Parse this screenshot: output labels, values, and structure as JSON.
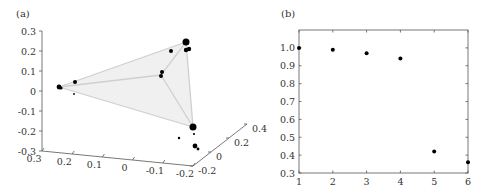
{
  "panels": {
    "a": "(a)",
    "b": "(b)"
  },
  "chart_data": [
    {
      "type": "scatter",
      "subtype": "3d-scatter",
      "panel_label": "(a)",
      "description": "3D scatter of points at vertices of a translucent tetrahedron (simplex)",
      "z_ticks": [
        "0.3",
        "0.2",
        "0.1",
        "0",
        "-0.1",
        "-0.2",
        "-0.3"
      ],
      "x_ticks": [
        "0.3",
        "0.2",
        "0.1",
        "0",
        "-0.1",
        "-0.2"
      ],
      "y_ticks": [
        "-0.2",
        "0",
        "0.2",
        "0.4"
      ],
      "zlim": [
        -0.3,
        0.3
      ],
      "xlim": [
        0.3,
        -0.2
      ],
      "ylim": [
        -0.2,
        0.4
      ],
      "grid": false,
      "vertices_screen": [
        {
          "name": "top-right",
          "x": 186,
          "y": 42
        },
        {
          "name": "left",
          "x": 59,
          "y": 87
        },
        {
          "name": "inner",
          "x": 161,
          "y": 75
        },
        {
          "name": "bottom",
          "x": 193,
          "y": 127
        }
      ],
      "points_screen": [
        {
          "x": 186,
          "y": 42,
          "r": 3.5
        },
        {
          "x": 189,
          "y": 49,
          "r": 2.2
        },
        {
          "x": 186,
          "y": 50,
          "r": 2.2
        },
        {
          "x": 171,
          "y": 51,
          "r": 2
        },
        {
          "x": 162,
          "y": 72,
          "r": 2
        },
        {
          "x": 161,
          "y": 76,
          "r": 2
        },
        {
          "x": 59,
          "y": 87,
          "r": 2.4
        },
        {
          "x": 61,
          "y": 88,
          "r": 1.6
        },
        {
          "x": 75,
          "y": 82,
          "r": 2
        },
        {
          "x": 74,
          "y": 94,
          "r": 0.9
        },
        {
          "x": 193,
          "y": 127,
          "r": 3.5
        },
        {
          "x": 194,
          "y": 134,
          "r": 1.1
        },
        {
          "x": 179,
          "y": 138,
          "r": 1.2
        },
        {
          "x": 195,
          "y": 146,
          "r": 2.4
        },
        {
          "x": 198,
          "y": 149,
          "r": 1.4
        }
      ]
    },
    {
      "type": "scatter",
      "panel_label": "(b)",
      "title": "",
      "xlabel": "",
      "ylabel": "",
      "x": [
        1,
        2,
        3,
        4,
        5,
        6
      ],
      "values": [
        1.0,
        0.99,
        0.97,
        0.94,
        0.42,
        0.36
      ],
      "x_ticks": [
        "1",
        "2",
        "3",
        "4",
        "5",
        "6"
      ],
      "y_ticks": [
        "0.3",
        "0.4",
        "0.5",
        "0.6",
        "0.7",
        "0.8",
        "0.9",
        "1.0"
      ],
      "xlim": [
        1,
        6
      ],
      "ylim": [
        0.3,
        1.1
      ],
      "grid": false,
      "legend": null
    }
  ]
}
